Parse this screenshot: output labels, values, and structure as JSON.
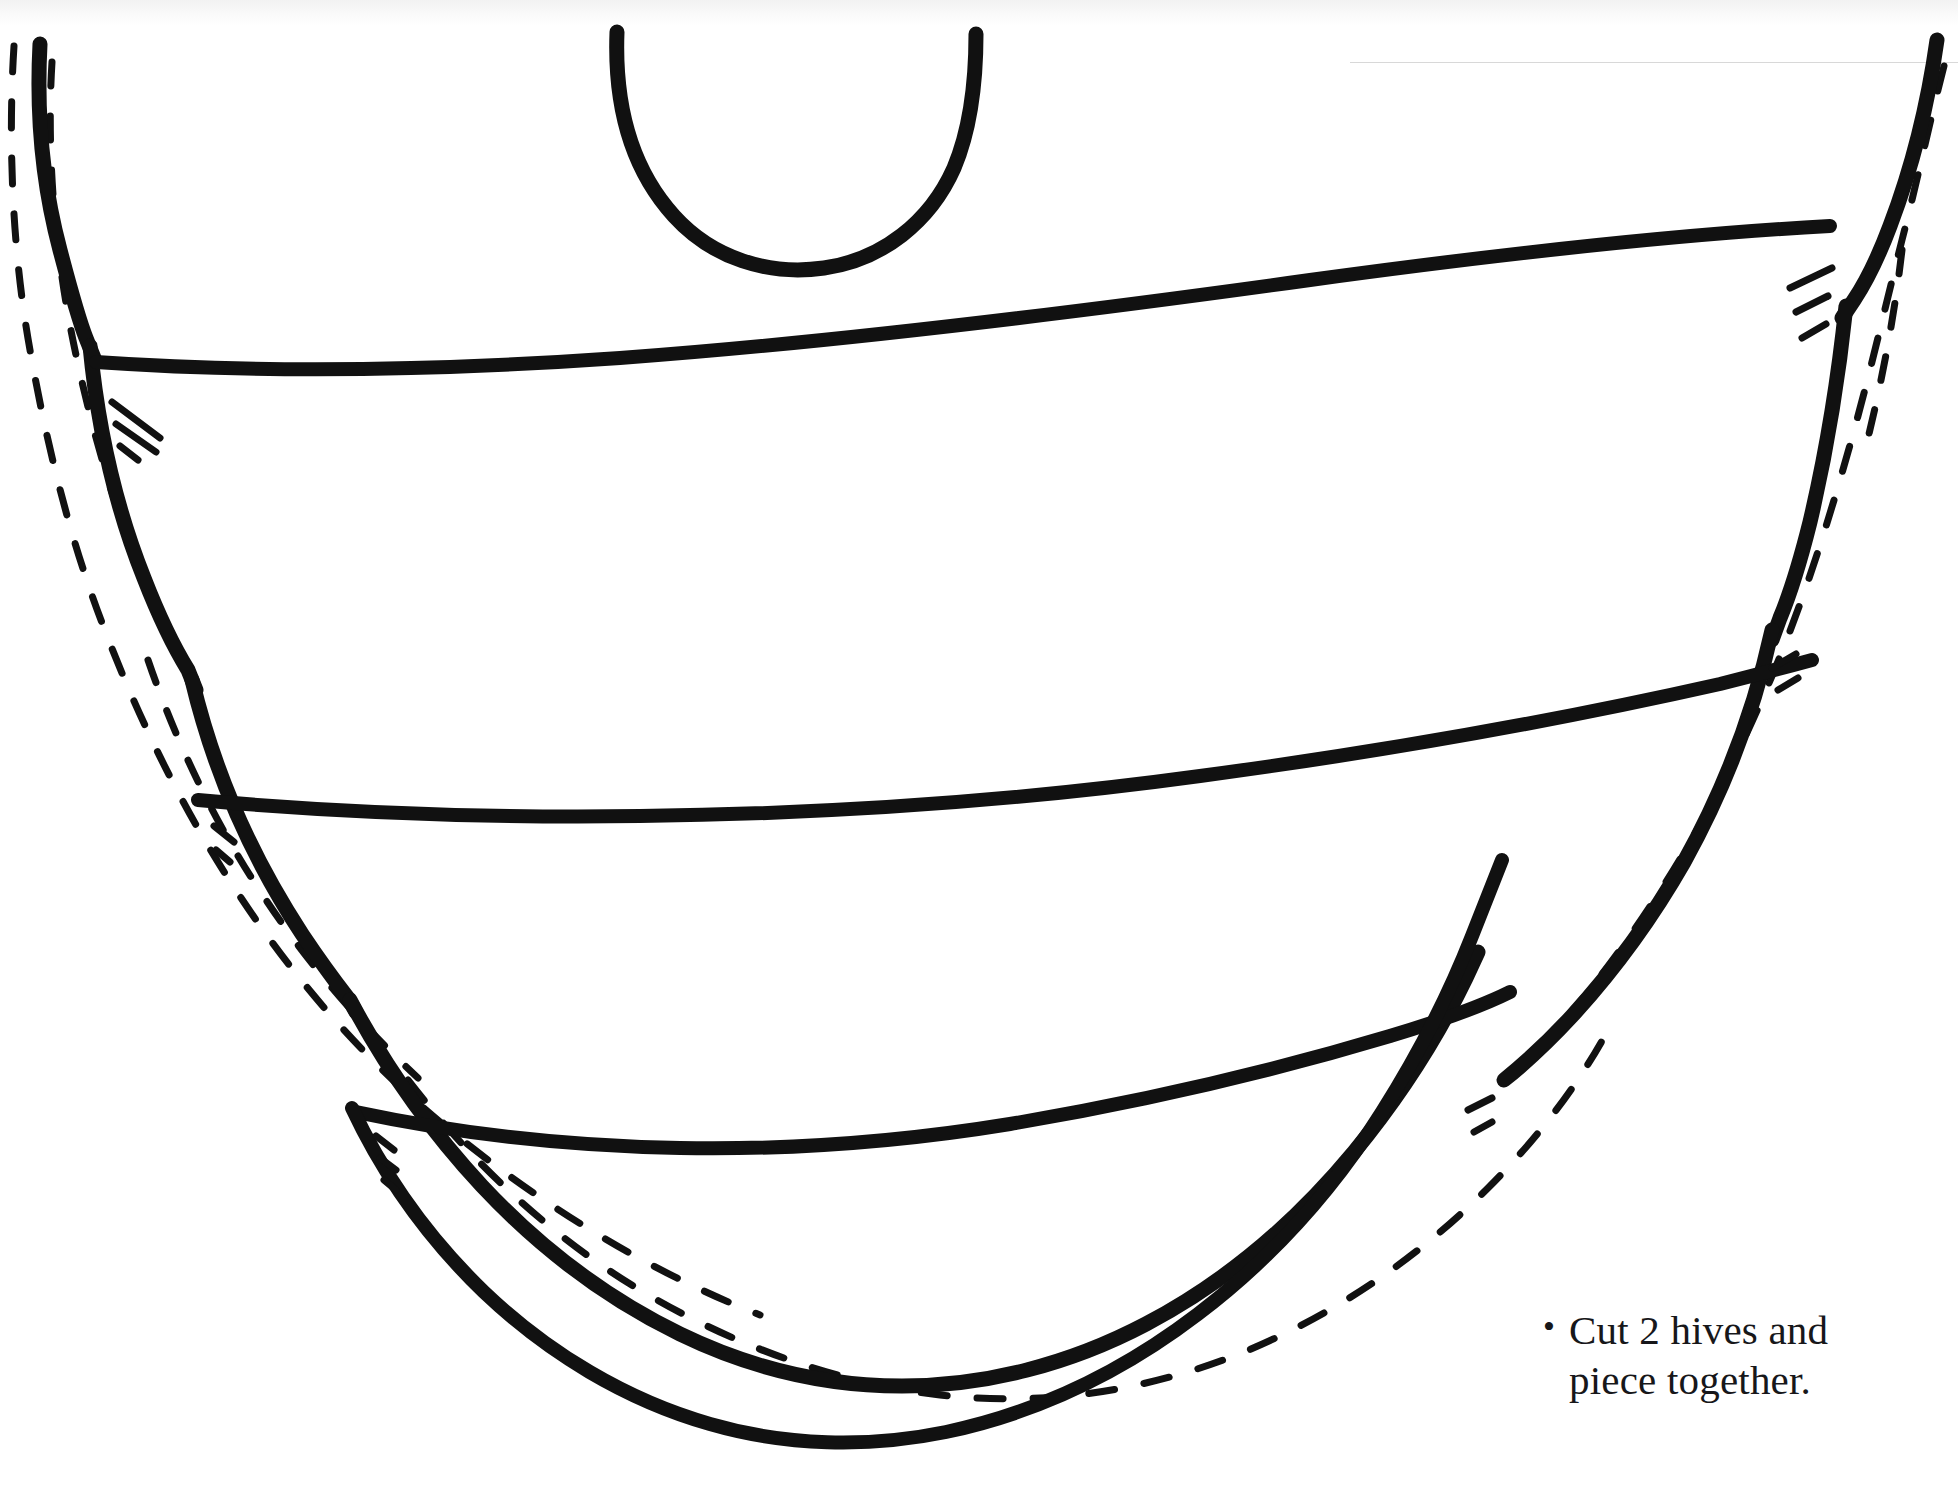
{
  "page": {
    "background_color": "#ffffff",
    "ink_color": "#111111",
    "width": 1958,
    "height": 1500
  },
  "caption": {
    "bullet": "•",
    "line1": "Cut 2 hives and",
    "line2": "piece together.",
    "full_text": "Cut 2 hives and piece together."
  },
  "pattern": {
    "name": "beehive-applique-pattern",
    "description": "Hand-drawn beehive sewing/applique pattern with cut lines, seam-allowance dashed lines and notch hatch marks.",
    "stroke_color": "#111111",
    "solid_stroke_width": 11,
    "thin_stroke_width": 8,
    "dash_stroke_width": 6,
    "dash_pattern": "26 30",
    "parts": [
      {
        "id": "top-arch",
        "label": "hive top opening arch"
      },
      {
        "id": "outer-contour-left",
        "label": "left cut line"
      },
      {
        "id": "outer-contour-right",
        "label": "right cut line"
      },
      {
        "id": "band-line-1",
        "label": "first hive band seam"
      },
      {
        "id": "band-line-2",
        "label": "second hive band seam"
      },
      {
        "id": "band-line-3",
        "label": "third hive band seam"
      },
      {
        "id": "bottom-arc",
        "label": "hive bottom cut line"
      },
      {
        "id": "seam-allowance-left",
        "label": "left dashed seam allowance"
      },
      {
        "id": "seam-allowance-right",
        "label": "right dashed seam allowance"
      },
      {
        "id": "seam-allowance-bottom",
        "label": "bottom dashed seam allowance"
      },
      {
        "id": "notch-marks",
        "label": "registration hatch marks"
      }
    ]
  }
}
